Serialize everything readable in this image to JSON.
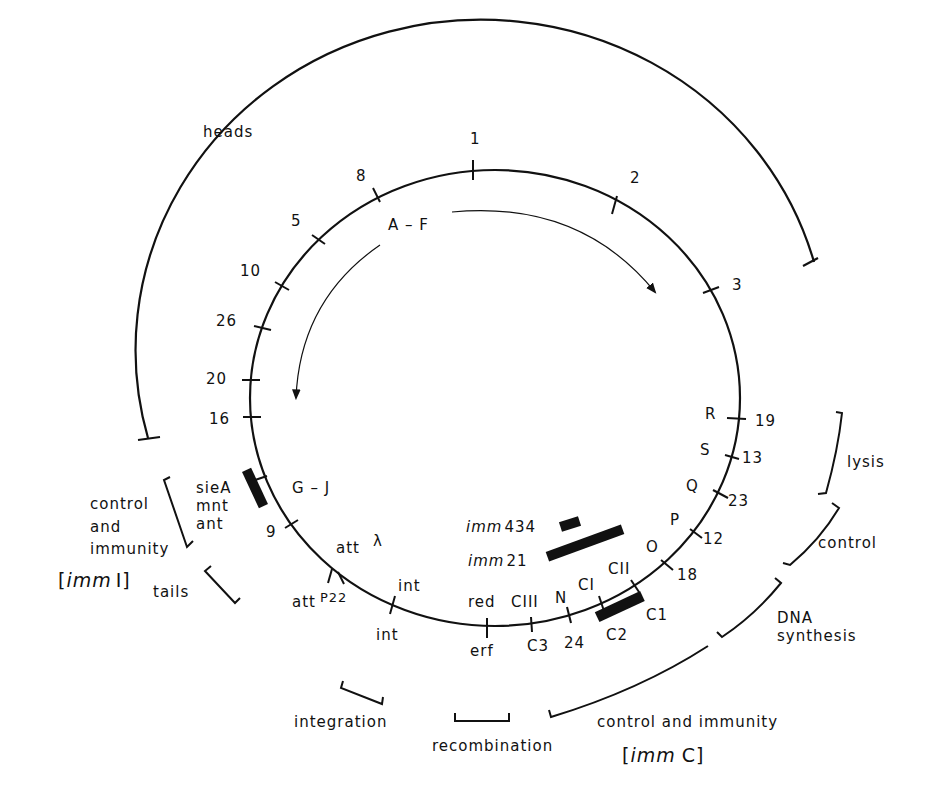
{
  "diagram": {
    "circle_markers": [
      {
        "id": "m1",
        "label": "1",
        "angle": -88
      },
      {
        "id": "m2",
        "label": "2",
        "angle": -57
      },
      {
        "id": "m3",
        "label": "3",
        "angle": -24
      },
      {
        "id": "m8",
        "label": "8",
        "angle": -116
      },
      {
        "id": "m5",
        "label": "5",
        "angle": -131
      },
      {
        "id": "m10",
        "label": "10",
        "angle": -147
      },
      {
        "id": "m26",
        "label": "26",
        "angle": -160
      },
      {
        "id": "m20",
        "label": "20",
        "angle": -173
      },
      {
        "id": "m16",
        "label": "16",
        "angle": 177
      }
    ],
    "genes_right": [
      {
        "gene": "R",
        "number": "19"
      },
      {
        "gene": "S",
        "number": "13"
      },
      {
        "gene": "Q",
        "number": "23"
      },
      {
        "gene": "P",
        "number": "12"
      },
      {
        "gene": "O",
        "number": "18"
      }
    ],
    "genes_bottom": {
      "cii": "CII",
      "ci": "CI",
      "c1": "C1",
      "c2": "C2",
      "n": "N",
      "n24": "24",
      "ciii": "CIII",
      "c3": "C3",
      "red": "red",
      "erf": "erf",
      "int_top": "int",
      "int_bottom": "int",
      "att_lambda": "att",
      "lambda": "λ",
      "att_p22": "att",
      "p22": "P22"
    },
    "genes_left": {
      "gj": "G – J",
      "nine": "9",
      "siea": "sieA",
      "mnt": "mnt",
      "ant": "ant"
    },
    "arrow_label": "A – F",
    "immunity_bars": [
      {
        "label_imm": "imm",
        "label_num": "434"
      },
      {
        "label_imm": "imm",
        "label_num": "21"
      }
    ],
    "functional_regions": {
      "heads": "heads",
      "lysis": "lysis",
      "control": "control",
      "dna_synthesis_1": "DNA",
      "dna_synthesis_2": "synthesis",
      "control_immunity_c": "control and immunity",
      "imm_c_open": "[",
      "imm_c_imm": "imm",
      "imm_c_close": "C]",
      "recombination": "recombination",
      "integration": "integration",
      "tails": "tails",
      "control_immunity_l1": "control",
      "control_immunity_l2": "and",
      "control_immunity_l3": "immunity",
      "imm_i_open": "[",
      "imm_i_imm": "imm",
      "imm_i_close": "I]"
    }
  }
}
